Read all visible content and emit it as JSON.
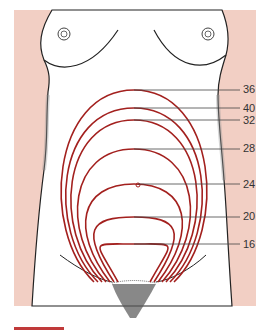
{
  "diagram": {
    "background_color": "#f2cfc4",
    "curve_color": "#a3201e",
    "labels": [
      {
        "week": "36",
        "x": 242,
        "y": 90
      },
      {
        "week": "40",
        "x": 242,
        "y": 108
      },
      {
        "week": "32",
        "x": 242,
        "y": 120
      },
      {
        "week": "28",
        "x": 242,
        "y": 149
      },
      {
        "week": "24",
        "x": 242,
        "y": 184
      },
      {
        "week": "20",
        "x": 242,
        "y": 217
      },
      {
        "week": "16",
        "x": 242,
        "y": 244
      }
    ]
  }
}
